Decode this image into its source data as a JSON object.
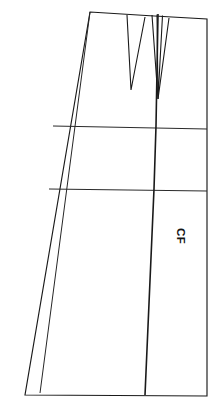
{
  "figure": {
    "type": "sewing-pattern-draft",
    "background_color": "#ffffff",
    "line_color": "#1a1a1a"
  },
  "annotations": {
    "center_front": {
      "label": "CF",
      "meaning": "Center Front",
      "rotation_degrees": 90,
      "x": 186,
      "y": 228
    }
  },
  "geometry": {
    "canvas": {
      "width": 220,
      "height": 413
    },
    "outline": {
      "name": "skirt-front-outline",
      "points": "90,12 150,16 207,19 207,396 25,395 47,126",
      "description": "Waist curve from left corner rising to right top corner, straight center-front right edge down to hem, hem to left hem point, side seam back up"
    },
    "side_seam": {
      "name": "side-seam-edge",
      "from": [
        90,
        12
      ],
      "to": [
        25,
        395
      ]
    },
    "inner_side_line": {
      "name": "inner-side-seam-line",
      "from": [
        90,
        12
      ],
      "to": [
        40,
        393
      ]
    },
    "hem_line": {
      "name": "hem-edge",
      "from": [
        25,
        395
      ],
      "to": [
        207,
        396
      ]
    },
    "center_front_edge": {
      "name": "center-front-edge",
      "from": [
        207,
        19
      ],
      "to": [
        207,
        396
      ]
    },
    "grain_line": {
      "name": "center-front-grain-line",
      "points": "158,14 156,126 154,189 145,395"
    },
    "guide_lines": [
      {
        "name": "hip-guide-line-upper",
        "from": [
          53,
          126
        ],
        "to": [
          207,
          129
        ]
      },
      {
        "name": "hip-guide-line-lower",
        "from": [
          49,
          189
        ],
        "to": [
          207,
          191
        ]
      }
    ],
    "darts": [
      {
        "name": "dart-left",
        "left_leg": {
          "from": [
            127,
            15
          ],
          "to": [
            131,
            90
          ]
        },
        "right_leg": {
          "from": [
            145,
            17
          ],
          "to": [
            131,
            90
          ]
        },
        "apex": [
          131,
          90
        ],
        "opening_width": 18
      },
      {
        "name": "dart-right-outer",
        "left_leg": {
          "from": [
            152,
            15
          ],
          "to": [
            158,
            99
          ]
        },
        "right_leg": {
          "from": [
            169,
            18
          ],
          "to": [
            158,
            99
          ]
        },
        "apex": [
          158,
          99
        ],
        "opening_width": 17
      },
      {
        "name": "dart-right-inner",
        "left_leg": {
          "from": [
            157,
            15
          ],
          "to": [
            158,
            99
          ]
        },
        "right_leg": {
          "from": [
            162,
            16
          ],
          "to": [
            158,
            99
          ]
        },
        "apex": [
          158,
          99
        ],
        "opening_width": 5
      }
    ]
  }
}
